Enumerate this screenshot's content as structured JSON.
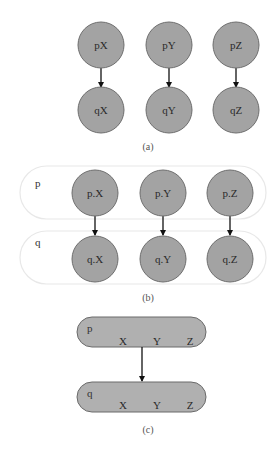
{
  "colors": {
    "node_fill": "#a3a3a3",
    "node_stroke": "#6e6e6e",
    "group_fill_c": "#b0b0b0",
    "group_stroke_b": "#e8e8e8",
    "edge": "#111111",
    "background": "#ffffff"
  },
  "panel_a": {
    "caption": "(a)",
    "nodes": [
      {
        "id": "pX",
        "label": "pX"
      },
      {
        "id": "pY",
        "label": "pY"
      },
      {
        "id": "pZ",
        "label": "pZ"
      },
      {
        "id": "qX",
        "label": "qX"
      },
      {
        "id": "qY",
        "label": "qY"
      },
      {
        "id": "qZ",
        "label": "qZ"
      }
    ],
    "edges": [
      {
        "from": "pX",
        "to": "qX"
      },
      {
        "from": "pY",
        "to": "qY"
      },
      {
        "from": "pZ",
        "to": "qZ"
      }
    ]
  },
  "panel_b": {
    "caption": "(b)",
    "groups": [
      {
        "id": "p",
        "label": "p"
      },
      {
        "id": "q",
        "label": "q"
      }
    ],
    "nodes": [
      {
        "id": "p.X",
        "label": "p.X"
      },
      {
        "id": "p.Y",
        "label": "p.Y"
      },
      {
        "id": "p.Z",
        "label": "p.Z"
      },
      {
        "id": "q.X",
        "label": "q.X"
      },
      {
        "id": "q.Y",
        "label": "q.Y"
      },
      {
        "id": "q.Z",
        "label": "q.Z"
      }
    ],
    "edges": [
      {
        "from": "p.X",
        "to": "q.X"
      },
      {
        "from": "p.Y",
        "to": "q.Y"
      },
      {
        "from": "p.Z",
        "to": "q.Z"
      }
    ]
  },
  "panel_c": {
    "caption": "(c)",
    "groups": [
      {
        "id": "p",
        "label": "p",
        "fields": [
          "X",
          "Y",
          "Z"
        ]
      },
      {
        "id": "q",
        "label": "q",
        "fields": [
          "X",
          "Y",
          "Z"
        ]
      }
    ],
    "edges": [
      {
        "from": "p",
        "to": "q"
      }
    ]
  }
}
